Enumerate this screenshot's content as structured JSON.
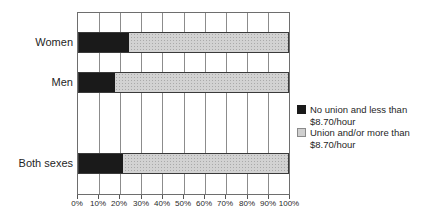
{
  "chart_data": {
    "type": "bar",
    "orientation": "horizontal",
    "stacked": true,
    "title": "",
    "categories": [
      "Women",
      "Men",
      "Both sexes"
    ],
    "series": [
      {
        "name": "No union and less than $8.70/hour",
        "color": "#1a1a1a",
        "values": [
          24,
          17,
          21
        ]
      },
      {
        "name": "Union and/or more than $8.70/hour",
        "color": "#cfcfcf",
        "values": [
          76,
          83,
          79
        ]
      }
    ],
    "x_ticks": [
      "0%",
      "10%",
      "20%",
      "30%",
      "40%",
      "50%",
      "60%",
      "70%",
      "80%",
      "90%",
      "100%"
    ],
    "xlim": [
      0,
      100
    ],
    "grid": "vertical-gridlines-with-frame",
    "legend_position": "right-middle"
  },
  "legend": {
    "items": [
      {
        "label": "No union and less than $8.70/hour",
        "color": "#1a1a1a"
      },
      {
        "label": "Union and/or more than $8.70/hour",
        "color": "#cfcfcf"
      }
    ]
  },
  "colors": {
    "background": "#ffffff",
    "gridline": "#8c8c8c",
    "frame": "#6e6e6e",
    "bar_border": "#3a3a3a",
    "text": "#1f1f1f"
  }
}
